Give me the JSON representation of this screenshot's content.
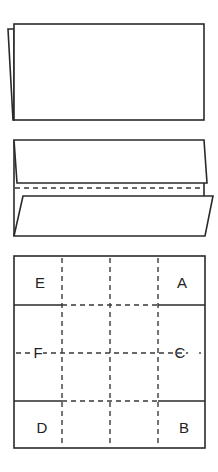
{
  "figure": {
    "step1": {
      "description": "Sheet folded in half, back layer visible on left edge"
    },
    "step2": {
      "description": "Top and bottom edges folded to center line with dashed fold line"
    },
    "step3": {
      "description": "Square grid with dashed fold lines and lettered corner regions",
      "labels": {
        "top_left": "E",
        "top_right": "A",
        "middle_left": "F",
        "middle_right": "C",
        "bottom_left": "D",
        "bottom_right": "B"
      }
    }
  },
  "colors": {
    "line": "#2a2a2a",
    "background": "#ffffff"
  }
}
